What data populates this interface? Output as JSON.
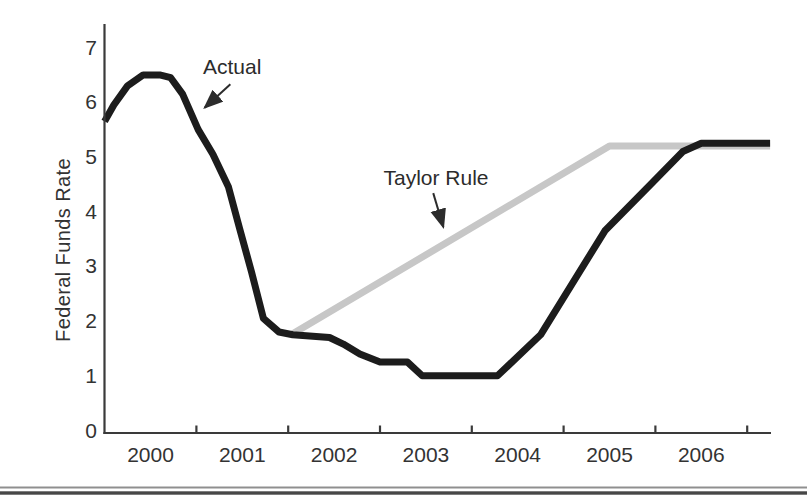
{
  "colors": {
    "actual_line": "#1c1c1c",
    "taylor_rule_line": "#c7c7c7",
    "axis": "#3a3a3a",
    "text": "#2c2c2c",
    "bottom_rule_thin": "#8f8f8f",
    "bottom_rule_thick": "#474747"
  },
  "bottom_rule": {
    "style": "double-rule page separator"
  },
  "chart_data": {
    "type": "line",
    "title": "",
    "xlabel": "",
    "ylabel": "Federal Funds Rate",
    "x_tick_years": [
      2000,
      2001,
      2002,
      2003,
      2004,
      2005,
      2006
    ],
    "x_boundary_ticks": [
      2001,
      2002,
      2003,
      2004,
      2005,
      2006,
      2007
    ],
    "y_ticks": [
      0,
      1,
      2,
      3,
      4,
      5,
      6,
      7
    ],
    "xlim": [
      2000,
      2007.25
    ],
    "ylim": [
      0,
      7.45
    ],
    "grid": false,
    "legend_position": "inline-annotations",
    "series": [
      {
        "name": "Actual",
        "color": "#1c1c1c",
        "width": 7,
        "points": [
          [
            2000.0,
            5.65
          ],
          [
            2000.1,
            5.95
          ],
          [
            2000.25,
            6.3
          ],
          [
            2000.42,
            6.5
          ],
          [
            2000.6,
            6.5
          ],
          [
            2000.72,
            6.45
          ],
          [
            2000.85,
            6.15
          ],
          [
            2001.02,
            5.5
          ],
          [
            2001.18,
            5.05
          ],
          [
            2001.35,
            4.45
          ],
          [
            2001.47,
            3.7
          ],
          [
            2001.6,
            2.9
          ],
          [
            2001.73,
            2.05
          ],
          [
            2001.9,
            1.8
          ],
          [
            2002.05,
            1.75
          ],
          [
            2002.45,
            1.7
          ],
          [
            2002.6,
            1.58
          ],
          [
            2002.78,
            1.4
          ],
          [
            2003.0,
            1.25
          ],
          [
            2003.3,
            1.25
          ],
          [
            2003.46,
            1.0
          ],
          [
            2004.28,
            1.0
          ],
          [
            2004.75,
            1.75
          ],
          [
            2005.45,
            3.65
          ],
          [
            2005.95,
            4.5
          ],
          [
            2006.3,
            5.1
          ],
          [
            2006.5,
            5.25
          ],
          [
            2007.25,
            5.25
          ]
        ]
      },
      {
        "name": "Taylor Rule",
        "color": "#c7c7c7",
        "width": 7,
        "points": [
          [
            2002.03,
            1.75
          ],
          [
            2005.5,
            5.2
          ],
          [
            2007.25,
            5.2
          ]
        ]
      }
    ],
    "annotations": [
      {
        "label": "Actual",
        "x": 2001.39,
        "y": 6.64,
        "arrow_from": [
          2001.37,
          6.33
        ],
        "arrow_to": [
          2001.09,
          5.9
        ]
      },
      {
        "label": "Taylor Rule",
        "x": 2003.61,
        "y": 4.62,
        "arrow_from": [
          2003.58,
          4.34
        ],
        "arrow_to": [
          2003.69,
          3.72
        ]
      }
    ]
  }
}
